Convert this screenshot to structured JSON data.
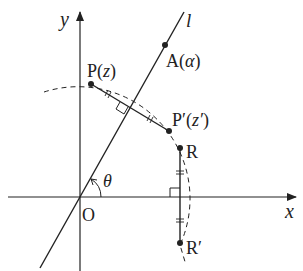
{
  "diagram": {
    "axes": {
      "x_label": "x",
      "y_label": "y",
      "origin_label": "O"
    },
    "line_label": "l",
    "angle_label": "θ",
    "points": {
      "P": {
        "name": "P",
        "arg": "z"
      },
      "P_prime": {
        "name": "P′",
        "arg": "z′"
      },
      "A": {
        "name": "A",
        "arg": "α"
      },
      "R": {
        "name": "R"
      },
      "R_prime": {
        "name": "R′"
      }
    },
    "colors": {
      "ink": "#222222",
      "background": "#ffffff"
    }
  }
}
